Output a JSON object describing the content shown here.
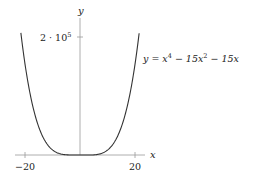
{
  "chart_data": {
    "type": "line",
    "title": "",
    "xlabel": "x",
    "ylabel": "y",
    "x_ticks": [
      -20,
      20
    ],
    "x_tick_labels": [
      "−20",
      "20"
    ],
    "y_ticks": [
      200000
    ],
    "y_tick_labels": [
      "2 · 10⁵"
    ],
    "xlim": [
      -21.5,
      21.5
    ],
    "ylim": [
      0,
      207000
    ],
    "grid": false,
    "legend": "none",
    "annotations": [
      "y = x⁴ − 15x² − 15x"
    ],
    "series": [
      {
        "name": "y = x^4 - 15x^2 - 15x",
        "formula": "x^4 - 15x^2 - 15x",
        "x": [
          -21.5,
          -20,
          -15,
          -10,
          -5,
          0,
          5,
          10,
          15,
          20,
          21.5
        ],
        "y": [
          206776,
          154300,
          47475,
          8650,
          325,
          0,
          175,
          8350,
          47025,
          153700,
          206131
        ]
      }
    ]
  },
  "labels": {
    "x_axis": "x",
    "y_axis": "y",
    "y_tick": "2 · 10",
    "y_tick_exp": "5",
    "x_tick_neg": "−20",
    "x_tick_pos": "20",
    "equation_prefix": "y = x",
    "equation_exp1": "4",
    "equation_mid": " − 15x",
    "equation_exp2": "2",
    "equation_suffix": " − 15x"
  }
}
